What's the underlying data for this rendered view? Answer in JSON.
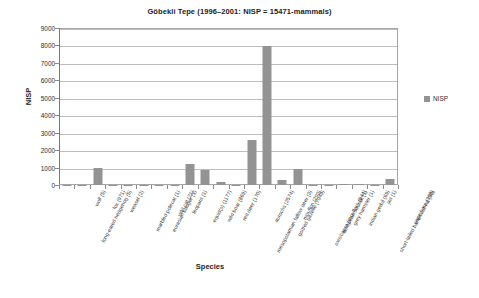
{
  "chart_data": {
    "type": "bar",
    "title": "Göbekli Tepe (1996–2001: NISP = 15471-mammals)",
    "xlabel": "Species",
    "ylabel": "NISP",
    "ylim": [
      0,
      9000
    ],
    "ytick_step": 1000,
    "yticks": [
      "0",
      "1000",
      "2000",
      "3000",
      "4000",
      "5000",
      "6000",
      "7000",
      "8000",
      "9000"
    ],
    "grid": true,
    "legend_position": "right",
    "legend": [
      "NISP"
    ],
    "series_name": "NISP",
    "bar_color": "#939393",
    "categories": [
      "long-eared hedgehog (5)",
      "wolf (5)",
      "fox (971)",
      "weasel (2)",
      "marbled polecat (1)",
      "eurasian badger (1)",
      "wild cat (21)",
      "leopard (1)",
      "equid(s) (1177)",
      "wild boar (869)",
      "red deer (170)",
      "mesopotamian fallow deer (3)",
      "aurochs (2574)",
      "goitred gazelle (7949)",
      "mouflon (293)",
      "ovis/capra (mouflon) (944)",
      "european souslik (1)",
      "grey hamster (1)",
      "indian gerbil (69)",
      "short-tailed bandicoot-rat (33)",
      "jird (1)",
      "cape hare (368)"
    ],
    "values": [
      5,
      5,
      971,
      2,
      1,
      1,
      21,
      1,
      1177,
      869,
      170,
      3,
      2574,
      7949,
      293,
      944,
      1,
      1,
      69,
      33,
      1,
      368
    ]
  }
}
